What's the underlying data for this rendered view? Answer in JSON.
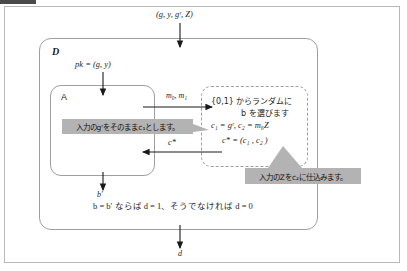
{
  "diagram": {
    "title_labels": {
      "input_tuple": "(g, y, gʳ, Z)",
      "outer_party": "D",
      "inner_party": "A",
      "public_key": "pk = (g, y)",
      "messages": "m₀, m₁",
      "challenge_ciphertext": "c*",
      "adversary_guess": "b′",
      "final_output": "d"
    },
    "dashed_box": {
      "line1": "{0,1} からランダムに",
      "line2": "b を選びます",
      "line3": "c₁ = gʳ, c₂ = m₆Z",
      "line4": "c* = (c₁ , c₂ )"
    },
    "callouts": [
      {
        "id": "callout-gr",
        "text": "入力のgʳをそのままc₁とします。"
      },
      {
        "id": "callout-z",
        "text": "入力のZをc₂に仕込みます。"
      }
    ],
    "decision_rule": "b = b′ ならば d = 1、そうでなければ d = 0",
    "colors": {
      "callout_bg": "#b3b3b3",
      "frame_border": "#b9b9b9",
      "box_border": "#9e9e9e",
      "arrow": "#1a1a1a",
      "text": "#1f1f1f"
    }
  }
}
